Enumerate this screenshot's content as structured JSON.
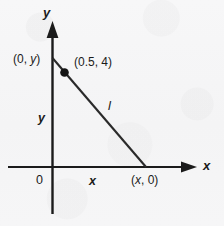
{
  "figure": {
    "name": "line-on-coordinate-plane",
    "background_color": "#f6f6f7",
    "ink_color": "#1b1b1b"
  },
  "axes": {
    "y_axis_label": "y",
    "x_axis_label": "x",
    "origin_label": "0"
  },
  "labels": {
    "y_intercept_point": "(0, y)",
    "marked_point": "(0.5, 4)",
    "x_intercept_point": "(x, 0)",
    "vertical_leg": "y",
    "horizontal_leg": "x",
    "line_name": "l"
  },
  "chart_data": {
    "type": "scatter",
    "title": "",
    "xlabel": "x",
    "ylabel": "y",
    "grid": false,
    "legend": "none",
    "annotations": [
      {
        "text": "(0, y)",
        "role": "y-intercept-label"
      },
      {
        "text": "(0.5, 4)",
        "role": "marked-point-label"
      },
      {
        "text": "(x, 0)",
        "role": "x-intercept-label"
      },
      {
        "text": "y",
        "role": "vertical-segment-label"
      },
      {
        "text": "x",
        "role": "horizontal-segment-label"
      },
      {
        "text": "l",
        "role": "line-label"
      },
      {
        "text": "0",
        "role": "origin-label"
      }
    ],
    "points": [
      {
        "label": "(0.5, 4)",
        "x": 0.5,
        "y": 4,
        "marker": "filled-circle"
      }
    ],
    "segments": [
      {
        "name": "l",
        "from": "(0, y)",
        "to": "(x, 0)",
        "description": "line l descending from the positive y-axis to the positive x-axis through (0.5, 4)"
      }
    ]
  }
}
